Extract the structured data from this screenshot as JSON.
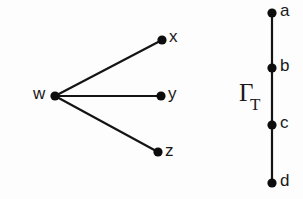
{
  "figure": {
    "background_color": "#fdfdfd",
    "ink_color": "#141414",
    "width": 303,
    "height": 199
  },
  "graphs": [
    {
      "id": "star-graph",
      "name": "",
      "kind": "star",
      "nodes": [
        {
          "id": "w",
          "label": "w",
          "cx": 55,
          "cy": 96,
          "r": 4.6,
          "label_x": 33,
          "label_y": 95,
          "label_anchor": "start"
        },
        {
          "id": "x",
          "label": "x",
          "cx": 162,
          "cy": 40,
          "r": 4.6,
          "label_x": 169,
          "label_y": 38,
          "label_anchor": "start"
        },
        {
          "id": "y",
          "label": "y",
          "cx": 161,
          "cy": 96,
          "r": 4.6,
          "label_x": 168,
          "label_y": 95,
          "label_anchor": "start"
        },
        {
          "id": "z",
          "label": "z",
          "cx": 158,
          "cy": 152,
          "r": 4.6,
          "label_x": 165,
          "label_y": 152,
          "label_anchor": "start"
        }
      ],
      "edges": [
        {
          "from": "w",
          "to": "x"
        },
        {
          "from": "w",
          "to": "y"
        },
        {
          "from": "w",
          "to": "z"
        }
      ]
    },
    {
      "id": "path-graph",
      "name": "Γ",
      "name_subscript": "T",
      "name_x": 239,
      "name_y": 95,
      "subscript_x": 250,
      "subscript_y": 106,
      "kind": "path",
      "nodes": [
        {
          "id": "a",
          "label": "a",
          "cx": 272,
          "cy": 13,
          "r": 4.6,
          "label_x": 280,
          "label_y": 12,
          "label_anchor": "start"
        },
        {
          "id": "b",
          "label": "b",
          "cx": 272,
          "cy": 68,
          "r": 4.6,
          "label_x": 280,
          "label_y": 67,
          "label_anchor": "start"
        },
        {
          "id": "c",
          "label": "c",
          "cx": 272,
          "cy": 125,
          "r": 4.6,
          "label_x": 280,
          "label_y": 124,
          "label_anchor": "start"
        },
        {
          "id": "d",
          "label": "d",
          "cx": 272,
          "cy": 183,
          "r": 4.6,
          "label_x": 280,
          "label_y": 182,
          "label_anchor": "start"
        }
      ],
      "edges": [
        {
          "from": "a",
          "to": "b"
        },
        {
          "from": "b",
          "to": "c"
        },
        {
          "from": "c",
          "to": "d"
        }
      ]
    }
  ]
}
